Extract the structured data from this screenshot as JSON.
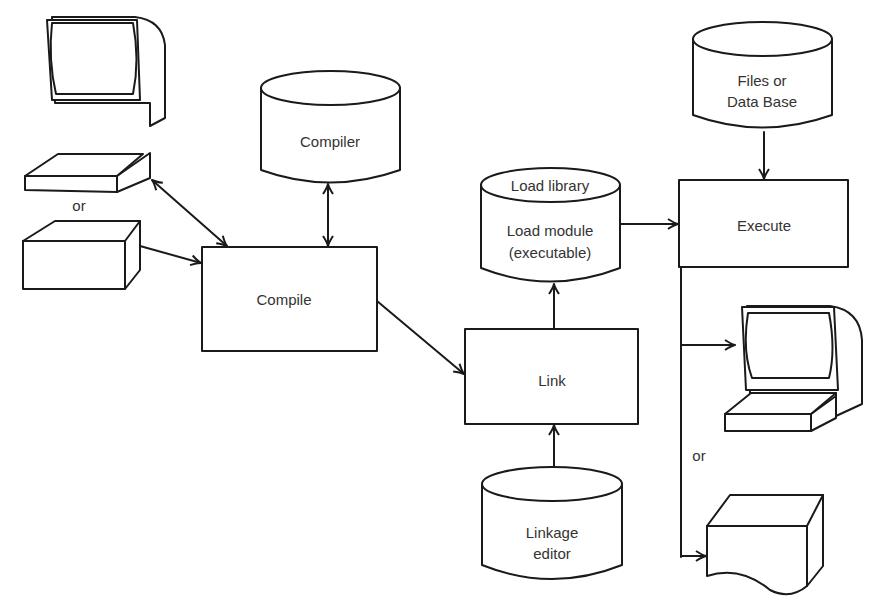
{
  "diagram": {
    "nodes": {
      "compiler": {
        "label": "Compiler",
        "shape": "cylinder"
      },
      "compile": {
        "label": "Compile",
        "shape": "box"
      },
      "load_library": {
        "label_top": "Load library",
        "label_line1": "Load module",
        "label_line2": "(executable)",
        "shape": "cylinder"
      },
      "link": {
        "label": "Link",
        "shape": "box"
      },
      "linkage_editor": {
        "label_line1": "Linkage",
        "label_line2": "editor",
        "shape": "cylinder"
      },
      "files": {
        "label_line1": "Files or",
        "label_line2": "Data Base",
        "shape": "cylinder"
      },
      "execute": {
        "label": "Execute",
        "shape": "box"
      },
      "input_terminal": {
        "icon": "terminal-icon"
      },
      "input_card_reader": {
        "icon": "card-reader-icon"
      },
      "output_terminal": {
        "icon": "terminal-icon"
      },
      "output_printer": {
        "icon": "printer-icon"
      }
    },
    "or_input": "or",
    "or_output": "or",
    "edges": [
      {
        "from": "input_terminal",
        "to": "compile",
        "bidirectional": true
      },
      {
        "from": "input_card_reader",
        "to": "compile"
      },
      {
        "from": "compiler",
        "to": "compile",
        "bidirectional": true
      },
      {
        "from": "compile",
        "to": "link"
      },
      {
        "from": "linkage_editor",
        "to": "link"
      },
      {
        "from": "link",
        "to": "load_library"
      },
      {
        "from": "load_library",
        "to": "execute"
      },
      {
        "from": "files",
        "to": "execute"
      },
      {
        "from": "execute",
        "to": "output_terminal"
      },
      {
        "from": "execute",
        "to": "output_printer"
      }
    ]
  }
}
